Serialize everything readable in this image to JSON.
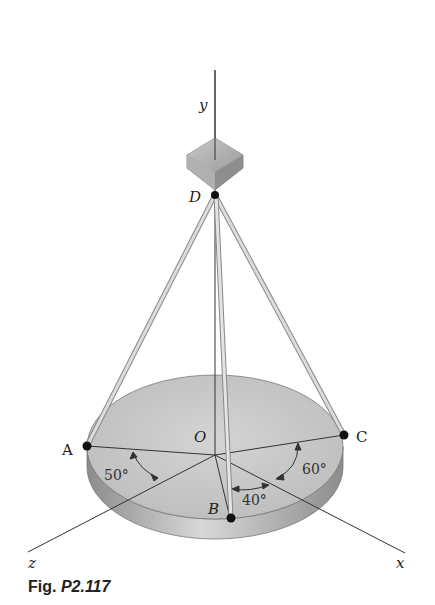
{
  "figure": {
    "caption_prefix": "Fig.",
    "caption_number": "P2.117"
  },
  "labels": {
    "y_axis": "y",
    "x_axis": "x",
    "z_axis": "z",
    "point_D": "D",
    "point_O": "O",
    "point_A": "A",
    "point_B": "B",
    "point_C": "C"
  },
  "angles": {
    "AOz": "50°",
    "BOx": "40°",
    "COx": "60°"
  },
  "colors": {
    "plate_top": "#c9c9c9",
    "plate_edge": "#9a9a9a",
    "cable": "#b5b5b5",
    "block": "#a8a8a8",
    "line": "#333333"
  }
}
